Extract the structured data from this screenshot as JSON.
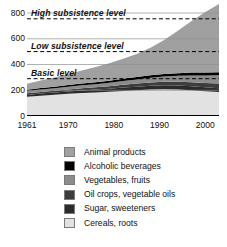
{
  "chart_data": {
    "type": "area",
    "stacked": true,
    "title": "",
    "xlabel": "",
    "ylabel": "",
    "xlim": [
      1961,
      2003
    ],
    "ylim": [
      0,
      870
    ],
    "grid": true,
    "legend_position": "bottom",
    "axis": {
      "y_ticks": [
        "0",
        "200",
        "400",
        "600",
        "800"
      ],
      "y_tick_values": [
        0,
        200,
        400,
        600,
        800
      ],
      "x_ticks": [
        "1961",
        "1970",
        "1980",
        "1990",
        "2000"
      ],
      "x_tick_values": [
        1961,
        1970,
        1980,
        1990,
        2000
      ]
    },
    "x": [
      1961,
      1964,
      1967,
      1970,
      1973,
      1976,
      1979,
      1982,
      1985,
      1988,
      1991,
      1994,
      1997,
      2000,
      2003
    ],
    "series": [
      {
        "name": "Cereals, roots",
        "color": "#e2e2e2",
        "values": [
          150,
          158,
          165,
          172,
          178,
          183,
          188,
          195,
          200,
          205,
          207,
          205,
          200,
          193,
          186
        ]
      },
      {
        "name": "Sugar, sweeteners",
        "color": "#2b2b2b",
        "values": [
          14,
          16,
          17,
          19,
          21,
          22,
          24,
          26,
          28,
          30,
          31,
          31,
          31,
          30,
          30
        ]
      },
      {
        "name": "Oil crops, vegetable oils",
        "color": "#3d3d3d",
        "values": [
          12,
          13,
          14,
          15,
          17,
          18,
          20,
          22,
          24,
          26,
          28,
          30,
          32,
          34,
          36
        ]
      },
      {
        "name": "Vegetables, fruits",
        "color": "#8c8c8c",
        "values": [
          18,
          19,
          20,
          21,
          23,
          24,
          26,
          29,
          32,
          36,
          40,
          46,
          52,
          58,
          64
        ]
      },
      {
        "name": "Alcoholic beverages",
        "color": "#000000",
        "values": [
          10,
          11,
          12,
          13,
          14,
          15,
          16,
          17,
          18,
          19,
          20,
          21,
          22,
          23,
          24
        ]
      },
      {
        "name": "Animal products",
        "color": "#a0a0a0",
        "values": [
          46,
          58,
          72,
          86,
          100,
          118,
          136,
          155,
          180,
          215,
          265,
          330,
          400,
          470,
          530
        ]
      }
    ],
    "reference_lines": [
      {
        "label": "High subsistence level",
        "value": 755,
        "style": "dashed"
      },
      {
        "label": "Low subsistence level",
        "value": 500,
        "style": "dashed"
      },
      {
        "label": "Basic level",
        "value": 290,
        "style": "dashed"
      }
    ],
    "top_clipped_text": ""
  },
  "legend": {
    "items": [
      {
        "label": "Animal products",
        "color": "#a0a0a0"
      },
      {
        "label": "Alcoholic beverages",
        "color": "#000000"
      },
      {
        "label": "Vegetables, fruits",
        "color": "#8c8c8c"
      },
      {
        "label": "Oil crops, vegetable oils",
        "color": "#3d3d3d"
      },
      {
        "label": "Sugar, sweeteners",
        "color": "#2b2b2b"
      },
      {
        "label": "Cereals, roots",
        "color": "#e2e2e2"
      }
    ]
  }
}
